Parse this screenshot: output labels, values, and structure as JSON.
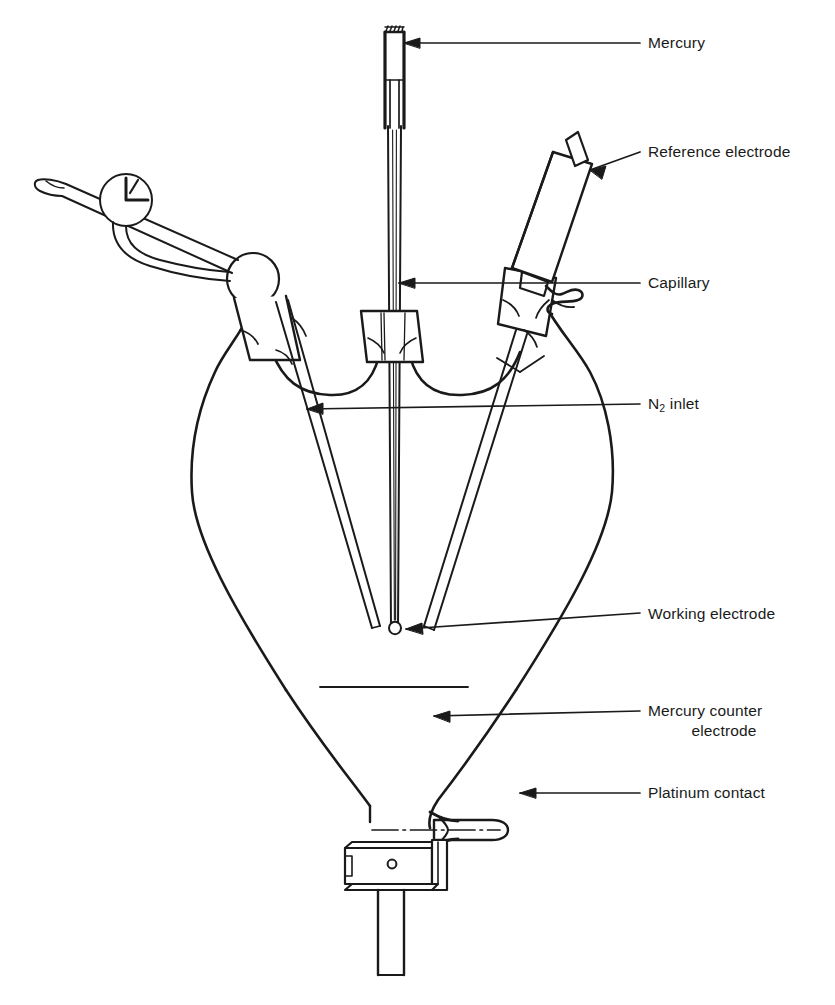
{
  "figure": {
    "kind": "line-drawing",
    "ink_color": "#1a1a1a",
    "background_color": "#ffffff"
  },
  "labels": [
    {
      "id": "mercury",
      "name": "label-mercury",
      "text": "Mercury",
      "x": 648,
      "y": 26,
      "leader": {
        "from_x": 640,
        "from_y": 43,
        "to_x": 402,
        "to_y": 43,
        "arrow": true
      }
    },
    {
      "id": "reference-electrode",
      "name": "label-reference-electrode",
      "text": "Reference electrode",
      "x": 648,
      "y": 140,
      "leader": {
        "from_x": 640,
        "from_y": 152,
        "to_x": 588,
        "to_y": 170,
        "arrow": true
      }
    },
    {
      "id": "capillary",
      "name": "label-capillary",
      "text": "Capillary",
      "x": 648,
      "y": 272,
      "leader": {
        "from_x": 640,
        "from_y": 283,
        "to_x": 398,
        "to_y": 283,
        "arrow": true
      }
    },
    {
      "id": "n2-inlet",
      "name": "label-n2-inlet",
      "text": "N2 inlet",
      "text_main": "N",
      "text_sub": "2",
      "text_tail": " inlet",
      "x": 648,
      "y": 394,
      "leader": {
        "from_x": 640,
        "from_y": 404,
        "to_x": 305,
        "to_y": 409,
        "arrow": true
      }
    },
    {
      "id": "working-electrode",
      "name": "label-working-electrode",
      "text": "Working electrode",
      "x": 648,
      "y": 604,
      "leader": {
        "from_x": 640,
        "from_y": 614,
        "to_x": 404,
        "to_y": 629,
        "arrow": true
      }
    },
    {
      "id": "mercury-counter-electrode",
      "name": "label-mercury-counter-electrode",
      "text_line1": "Mercury counter",
      "text_line2": "electrode",
      "x": 648,
      "y": 698,
      "leader": {
        "from_x": 640,
        "from_y": 712,
        "to_x": 432,
        "to_y": 716,
        "arrow": true
      }
    },
    {
      "id": "platinum-contact",
      "name": "label-platinum-contact",
      "text": "Platinum contact",
      "x": 648,
      "y": 782,
      "leader": {
        "from_x": 640,
        "from_y": 793,
        "to_x": 518,
        "to_y": 793,
        "arrow": true
      }
    }
  ],
  "parts": {
    "mercury_reservoir": "vertical tube with serrated open top at page top",
    "capillary": "fine twin-walled vertical tube descending to flask centre",
    "working_electrode_drop": "small mercury drop at capillary tip",
    "reference_electrode": "tilted cylindrical electrode body with side tube, right neck",
    "n2_inlet": "angled tube with stopcock entering left neck",
    "top_stopcock": "circular plug valve with T handle on inlet line",
    "mercury_level": "horizontal mercury surface line in lower cone",
    "platinum_contact": "horizontal sealed tube with centre wire at cone base",
    "bottom_stopcock": "barrel stopcock with bore hole below flask",
    "drain_tube": "vertical outlet tube at bottom"
  },
  "caption": {
    "text": "",
    "visible": false
  },
  "top_cut_line": {
    "text": "",
    "visible": false
  }
}
